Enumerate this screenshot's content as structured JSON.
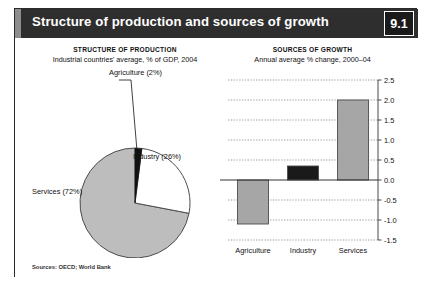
{
  "header": {
    "title": "Structure of production and sources of growth",
    "badge": "9.1",
    "bar_color": "#2e2e2e",
    "accent_color": "#8d8d8d"
  },
  "source_note": "Sources: OECD; World Bank",
  "palette": {
    "services_gray": "#bdbdbd",
    "industry_white": "#ffffff",
    "agriculture_black": "#111111",
    "bar_gray": "#a6a6a6",
    "bar_black": "#1a1a1a",
    "outline": "#4d4d4d",
    "grid": "#8c8c8c"
  },
  "chart_data": [
    {
      "type": "pie",
      "title": "STRUCTURE OF PRODUCTION",
      "subtitle": "Industrial countries' average, % of GDP, 2004",
      "xlabel": "",
      "ylabel": "",
      "legend_position": "callout-labels",
      "grid": false,
      "categories": [
        "Agriculture",
        "Industry",
        "Services"
      ],
      "values": [
        2,
        26,
        72
      ],
      "unit": "% of GDP",
      "labels": [
        "Agriculture (2%)",
        "Industry (26%)",
        "Services (72%)"
      ],
      "colors": [
        "#111111",
        "#ffffff",
        "#bdbdbd"
      ],
      "start_angle_deg": 0
    },
    {
      "type": "bar",
      "title": "SOURCES OF GROWTH",
      "subtitle": "Annual average % change, 2000–04",
      "xlabel": "",
      "ylabel": "",
      "unit": "annual average % change",
      "grid": true,
      "legend_position": "none",
      "categories": [
        "Agriculture",
        "Industry",
        "Services"
      ],
      "values": [
        -1.1,
        0.35,
        2.0
      ],
      "colors": [
        "#a6a6a6",
        "#1a1a1a",
        "#a6a6a6"
      ],
      "ylim": [
        -1.5,
        2.5
      ],
      "ytick_step": 0.5,
      "ytick_labels": [
        "2.5",
        "2.0",
        "1.5",
        "1.0",
        "0.5",
        "0.0",
        "-0.5",
        "-1.0",
        "-1.5"
      ],
      "ytick_values": [
        2.5,
        2.0,
        1.5,
        1.0,
        0.5,
        0.0,
        -0.5,
        -1.0,
        -1.5
      ]
    }
  ]
}
